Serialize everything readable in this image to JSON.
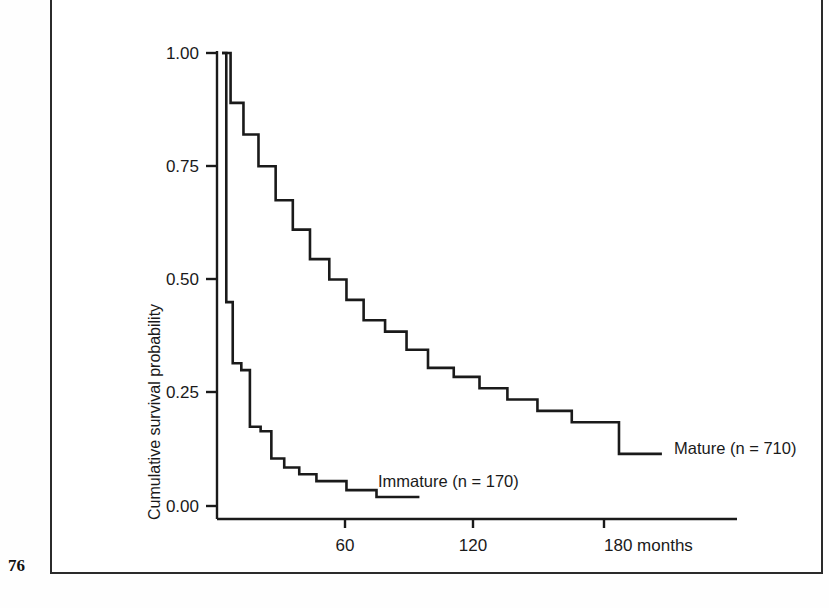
{
  "page": {
    "folio": "76"
  },
  "chart_data": {
    "type": "line",
    "subtype": "kaplan-meier-step",
    "title": "",
    "xlabel": "months",
    "ylabel": "Cumulative survival probability",
    "xlim": [
      0,
      240
    ],
    "ylim": [
      0.0,
      1.0
    ],
    "grid": false,
    "legend_position": "inline-at-curve-end",
    "x_ticks": [
      60,
      120,
      180
    ],
    "x_tick_labels": [
      "60",
      "120",
      "180 months"
    ],
    "y_ticks": [
      0.0,
      0.25,
      0.5,
      0.75,
      1.0
    ],
    "y_tick_labels": [
      "0.00",
      "0.25",
      "0.50",
      "0.75",
      "1.00"
    ],
    "series": [
      {
        "name": "Mature",
        "n": 710,
        "label": "Mature (n = 710)",
        "x": [
          0,
          4,
          4,
          10,
          10,
          17,
          17,
          25,
          25,
          33,
          33,
          41,
          41,
          50,
          50,
          58,
          58,
          66,
          66,
          76,
          76,
          86,
          86,
          96,
          96,
          108,
          108,
          120,
          120,
          133,
          133,
          147,
          147,
          163,
          163,
          185,
          185,
          205
        ],
        "y": [
          1.0,
          1.0,
          0.89,
          0.89,
          0.82,
          0.82,
          0.75,
          0.75,
          0.675,
          0.675,
          0.61,
          0.61,
          0.545,
          0.545,
          0.5,
          0.5,
          0.455,
          0.455,
          0.41,
          0.41,
          0.385,
          0.385,
          0.345,
          0.345,
          0.305,
          0.305,
          0.285,
          0.285,
          0.26,
          0.26,
          0.235,
          0.235,
          0.21,
          0.21,
          0.185,
          0.185,
          0.115,
          0.115
        ]
      },
      {
        "name": "Immature",
        "n": 170,
        "label": "Immature (n = 170)",
        "x": [
          0,
          2,
          2,
          5,
          5,
          9,
          9,
          13,
          13,
          18,
          18,
          23,
          23,
          29,
          29,
          36,
          36,
          44,
          44,
          58,
          58,
          72,
          72,
          92
        ],
        "y": [
          1.0,
          1.0,
          0.45,
          0.45,
          0.315,
          0.315,
          0.3,
          0.3,
          0.175,
          0.175,
          0.165,
          0.165,
          0.105,
          0.105,
          0.085,
          0.085,
          0.07,
          0.07,
          0.055,
          0.055,
          0.035,
          0.035,
          0.02,
          0.02
        ]
      }
    ]
  },
  "colors": {
    "ink": "#1a1a1a",
    "page_background": "#ffffff",
    "frame": "#2b2b2b"
  }
}
